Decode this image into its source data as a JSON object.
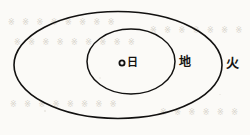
{
  "figure": {
    "type": "astronomical-orbit-diagram",
    "background_color": "#fbfaf7",
    "stroke_color": "#121110",
    "orbits": [
      {
        "name": "mars-orbit",
        "label": "火",
        "label_meaning": "fire / Mars",
        "cx": 118,
        "cy": 65,
        "rx": 104,
        "ry": 53.5,
        "stroke_width": 1.6,
        "label_x": 226,
        "label_y": 57
      },
      {
        "name": "earth-orbit",
        "label": "地",
        "label_meaning": "earth",
        "cx": 131,
        "cy": 61.5,
        "rx": 44,
        "ry": 32.5,
        "stroke_width": 1.5,
        "label_x": 179,
        "label_y": 55
      }
    ],
    "center_body": {
      "name": "sun",
      "label": "日",
      "label_meaning": "sun",
      "marker_cx": 122,
      "marker_cy": 63,
      "marker_r": 2.6,
      "marker_stroke_width": 1.8,
      "label_x": 126,
      "label_y": 57
    },
    "bleed_text": [
      {
        "text": "※ ※ ※ ※ ※ ※ ※ ※",
        "x": 8,
        "y": 22
      },
      {
        "text": "※ ※ ※ ※ ※ ※ ※ ※ ※",
        "x": 14,
        "y": 42
      },
      {
        "text": "※ ※ ※ ※ ※ ※ ※",
        "x": 150,
        "y": 30
      },
      {
        "text": "※ ※ ※ ※ ※ ※ ※ ※",
        "x": 10,
        "y": 104
      },
      {
        "text": "※ ※ ※ ※ ※ ※",
        "x": 160,
        "y": 112
      }
    ]
  }
}
